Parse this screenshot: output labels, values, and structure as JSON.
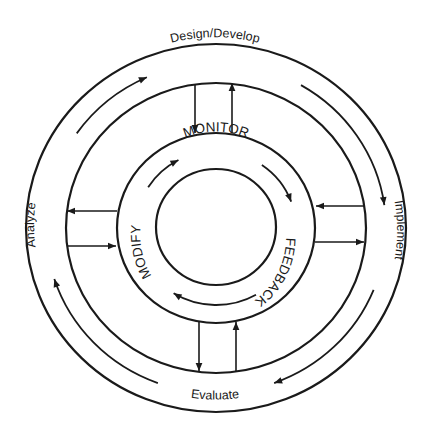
{
  "diagram": {
    "type": "cyclic-process",
    "outer_cycle": {
      "direction": "clockwise",
      "stages": [
        {
          "id": "design",
          "label": "Design/Develop",
          "position": "top"
        },
        {
          "id": "implement",
          "label": "Implement",
          "position": "right"
        },
        {
          "id": "evaluate",
          "label": "Evaluate",
          "position": "bottom"
        },
        {
          "id": "analyze",
          "label": "Analyze",
          "position": "left"
        }
      ]
    },
    "inner_cycle": {
      "direction": "clockwise",
      "stages": [
        {
          "id": "monitor",
          "label": "MONITOR",
          "position": "top"
        },
        {
          "id": "feedback",
          "label": "FEEDBACK",
          "position": "right"
        },
        {
          "id": "modify",
          "label": "MODIFY",
          "position": "left"
        }
      ]
    },
    "connectors": [
      {
        "between": "design-and-inner",
        "arrows": [
          "inward",
          "outward"
        ]
      },
      {
        "between": "implement-and-inner",
        "arrows": [
          "inward",
          "outward"
        ]
      },
      {
        "between": "evaluate-and-inner",
        "arrows": [
          "inward",
          "outward"
        ]
      },
      {
        "between": "analyze-and-inner",
        "arrows": [
          "outward",
          "inward"
        ]
      }
    ],
    "colors": {
      "stroke": "#1a1a1a",
      "background": "#ffffff"
    }
  }
}
